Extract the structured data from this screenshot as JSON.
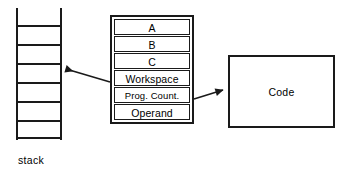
{
  "diagram": {
    "background_color": "#ffffff",
    "line_color": "#1a1a1a"
  },
  "stack": {
    "name": "stack",
    "caption": "stack",
    "cell_count": 6,
    "rung_count": 7,
    "rung_positions_y": [
      17,
      36,
      55,
      74,
      93,
      112,
      129
    ],
    "rail_positions_x": [
      0,
      44
    ]
  },
  "registers": {
    "rows": [
      {
        "label": "A"
      },
      {
        "label": "B"
      },
      {
        "label": "C"
      },
      {
        "label": "Workspace"
      },
      {
        "label": "Prog. Count."
      },
      {
        "label": "Operand"
      }
    ]
  },
  "code": {
    "label": "Code"
  },
  "arrows": [
    {
      "name": "workspace-to-stack",
      "from": "Workspace",
      "to": "stack",
      "direction": "left",
      "x1": 110,
      "y1": 82,
      "x2": 63,
      "y2": 69
    },
    {
      "name": "prog-count-to-code",
      "from": "Prog. Count.",
      "to": "Code",
      "direction": "right",
      "x1": 194,
      "y1": 99,
      "x2": 227,
      "y2": 89
    }
  ]
}
